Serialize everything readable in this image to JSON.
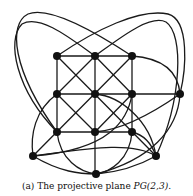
{
  "figure": {
    "caption_prefix": "(a) The projective plane ",
    "caption_math": "PG(2,3)",
    "caption_suffix": ".",
    "title": "The projective plane PG(2,3)",
    "colors": {
      "line": "#1a1a1a",
      "node": "#111111",
      "background": "#ffffff"
    }
  },
  "graph": {
    "nodes": [
      {
        "id": "a1",
        "x": 57,
        "y": 56
      },
      {
        "id": "a2",
        "x": 95,
        "y": 56
      },
      {
        "id": "a3",
        "x": 132,
        "y": 56
      },
      {
        "id": "b1",
        "x": 57,
        "y": 94
      },
      {
        "id": "b2",
        "x": 95,
        "y": 94
      },
      {
        "id": "b3",
        "x": 132,
        "y": 94
      },
      {
        "id": "c1",
        "x": 57,
        "y": 132
      },
      {
        "id": "c2",
        "x": 95,
        "y": 132
      },
      {
        "id": "c3",
        "x": 132,
        "y": 132
      },
      {
        "id": "r",
        "x": 180,
        "y": 94
      },
      {
        "id": "bl",
        "x": 33,
        "y": 156
      },
      {
        "id": "br",
        "x": 156,
        "y": 156
      },
      {
        "id": "bt",
        "x": 96,
        "y": 174
      }
    ],
    "node_count": 13
  }
}
